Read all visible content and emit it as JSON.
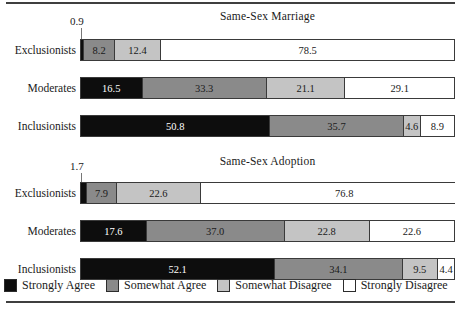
{
  "chart_data": {
    "type": "bar",
    "subtype": "stacked-horizontal-100",
    "title": "",
    "xlabel": "",
    "ylabel": "",
    "xlim": [
      0,
      100
    ],
    "grid": false,
    "legend_position": "bottom",
    "legend": [
      "Strongly Agree",
      "Somewhat Agree",
      "Somewhat Disagree",
      "Strongly Disagree"
    ],
    "series_colors": [
      "#0d0d0d",
      "#8a8a8a",
      "#c4c4c4",
      "#ffffff"
    ],
    "categories": [
      "Exclusionists",
      "Moderates",
      "Inclusionists"
    ],
    "panels": [
      {
        "title": "Same-Sex Marriage",
        "rows": [
          {
            "category": "Exclusionists",
            "values": [
              0.9,
              8.2,
              12.4,
              78.5
            ],
            "labels": [
              "0.9",
              "8.2",
              "12.4",
              "78.5"
            ],
            "callout": "0.9"
          },
          {
            "category": "Moderates",
            "values": [
              16.5,
              33.3,
              21.1,
              29.1
            ],
            "labels": [
              "16.5",
              "33.3",
              "21.1",
              "29.1"
            ],
            "callout": ""
          },
          {
            "category": "Inclusionists",
            "values": [
              50.8,
              35.7,
              4.6,
              8.9
            ],
            "labels": [
              "50.8",
              "35.7",
              "4.6",
              "8.9"
            ],
            "callout": ""
          }
        ]
      },
      {
        "title": "Same-Sex Adoption",
        "rows": [
          {
            "category": "Exclusionists",
            "values": [
              1.7,
              7.9,
              22.6,
              76.8
            ],
            "labels": [
              "1.7",
              "7.9",
              "22.6",
              "76.8"
            ],
            "callout": "1.7"
          },
          {
            "category": "Moderates",
            "values": [
              17.6,
              37.0,
              22.8,
              22.6
            ],
            "labels": [
              "17.6",
              "37.0",
              "22.8",
              "22.6"
            ],
            "callout": ""
          },
          {
            "category": "Inclusionists",
            "values": [
              52.1,
              34.1,
              9.5,
              4.4
            ],
            "labels": [
              "52.1",
              "34.1",
              "9.5",
              "4.4"
            ],
            "callout": ""
          }
        ]
      }
    ]
  },
  "panels": {
    "marriage": {
      "title": "Same-Sex Marriage",
      "callout": "0.9",
      "rows": [
        {
          "label": "Exclusionists",
          "segments": [
            {
              "value": "0.9",
              "width": 0.9,
              "cls": "sa",
              "tiny": true
            },
            {
              "value": "8.2",
              "width": 8.2,
              "cls": "swa",
              "tiny": false
            },
            {
              "value": "12.4",
              "width": 12.4,
              "cls": "swd",
              "tiny": false
            },
            {
              "value": "78.5",
              "width": 78.5,
              "cls": "sd",
              "tiny": false
            }
          ]
        },
        {
          "label": "Moderates",
          "segments": [
            {
              "value": "16.5",
              "width": 16.5,
              "cls": "sa",
              "tiny": false
            },
            {
              "value": "33.3",
              "width": 33.3,
              "cls": "swa",
              "tiny": false
            },
            {
              "value": "21.1",
              "width": 21.1,
              "cls": "swd",
              "tiny": false
            },
            {
              "value": "29.1",
              "width": 29.1,
              "cls": "sd",
              "tiny": false
            }
          ]
        },
        {
          "label": "Inclusionists",
          "segments": [
            {
              "value": "50.8",
              "width": 50.8,
              "cls": "sa",
              "tiny": false
            },
            {
              "value": "35.7",
              "width": 35.7,
              "cls": "swa",
              "tiny": false
            },
            {
              "value": "4.6",
              "width": 4.6,
              "cls": "swd",
              "tiny": false
            },
            {
              "value": "8.9",
              "width": 8.9,
              "cls": "sd",
              "tiny": false
            }
          ]
        }
      ]
    },
    "adoption": {
      "title": "Same-Sex Adoption",
      "callout": "1.7",
      "rows": [
        {
          "label": "Exclusionists",
          "segments": [
            {
              "value": "1.7",
              "width": 1.7,
              "cls": "sa",
              "tiny": true
            },
            {
              "value": "7.9",
              "width": 7.9,
              "cls": "swa",
              "tiny": false
            },
            {
              "value": "22.6",
              "width": 22.6,
              "cls": "swd",
              "tiny": false
            },
            {
              "value": "76.8",
              "width": 76.8,
              "cls": "sd",
              "tiny": false
            }
          ]
        },
        {
          "label": "Moderates",
          "segments": [
            {
              "value": "17.6",
              "width": 17.6,
              "cls": "sa",
              "tiny": false
            },
            {
              "value": "37.0",
              "width": 37.0,
              "cls": "swa",
              "tiny": false
            },
            {
              "value": "22.8",
              "width": 22.8,
              "cls": "swd",
              "tiny": false
            },
            {
              "value": "22.6",
              "width": 22.6,
              "cls": "sd",
              "tiny": false
            }
          ]
        },
        {
          "label": "Inclusionists",
          "segments": [
            {
              "value": "52.1",
              "width": 52.1,
              "cls": "sa",
              "tiny": false
            },
            {
              "value": "34.1",
              "width": 34.1,
              "cls": "swa",
              "tiny": false
            },
            {
              "value": "9.5",
              "width": 9.5,
              "cls": "swd",
              "tiny": false
            },
            {
              "value": "4.4",
              "width": 4.4,
              "cls": "sd",
              "tiny": false
            }
          ]
        }
      ]
    }
  },
  "legend": {
    "items": [
      {
        "label": "Strongly Agree",
        "cls": "sa",
        "color": "#0d0d0d"
      },
      {
        "label": "Somewhat Agree",
        "cls": "swa",
        "color": "#8a8a8a"
      },
      {
        "label": "Somewhat Disagree",
        "cls": "swd",
        "color": "#c4c4c4"
      },
      {
        "label": "Strongly Disagree",
        "cls": "sd",
        "color": "#ffffff"
      }
    ]
  }
}
